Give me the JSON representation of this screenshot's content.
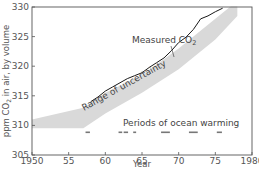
{
  "chart_data": {
    "type": "line",
    "title": "",
    "xlabel": "Year",
    "ylabel": "ppm CO2 in air, by volume",
    "xlim": [
      1950,
      1980
    ],
    "ylim": [
      305,
      330
    ],
    "x_ticks": [
      1950,
      1955,
      1960,
      1965,
      1970,
      1975,
      1980
    ],
    "x_tick_labels": [
      "1950",
      "55",
      "60",
      "65",
      "70",
      "75",
      "1980"
    ],
    "y_ticks": [
      305,
      310,
      315,
      320,
      325,
      330
    ],
    "y_tick_labels": [
      "305",
      "310",
      "315",
      "320",
      "325",
      "330"
    ],
    "grid": false,
    "series": [
      {
        "name": "Measured CO2",
        "type": "line",
        "x": [
          1958,
          1959,
          1960,
          1961,
          1962,
          1963,
          1964,
          1965,
          1966,
          1967,
          1968,
          1969,
          1970,
          1971,
          1972,
          1973,
          1974,
          1975,
          1976
        ],
        "values": [
          314.0,
          314.8,
          315.8,
          316.5,
          317.2,
          317.9,
          318.4,
          318.9,
          319.8,
          320.6,
          321.4,
          322.6,
          324.0,
          324.9,
          326.2,
          328.0,
          328.5,
          329.2,
          329.8
        ]
      },
      {
        "name": "Range of uncertainty",
        "type": "area",
        "x": [
          1950,
          1957,
          1960,
          1965,
          1970,
          1975,
          1978
        ],
        "lower": [
          309.5,
          309.5,
          312.0,
          315.5,
          319.5,
          324.5,
          328.5
        ],
        "upper": [
          311.0,
          313.0,
          315.5,
          318.5,
          323.0,
          328.0,
          331.0
        ]
      }
    ],
    "ocean_warming_periods": [
      [
        1957.3,
        1957.9
      ],
      [
        1961.8,
        1962.3
      ],
      [
        1962.5,
        1963.1
      ],
      [
        1963.8,
        1964.2
      ],
      [
        1967.6,
        1968.8
      ],
      [
        1971.4,
        1972.6
      ],
      [
        1975.2,
        1975.9
      ]
    ],
    "annotations": [
      {
        "text": "Measured CO2",
        "x": 1963.5,
        "y": 325.5
      },
      {
        "text": "Range of uncertainty",
        "x": 1957.5,
        "y": 316,
        "rotation": -28
      },
      {
        "text": "Periods of ocean warming",
        "x": 1961.5,
        "y": 310
      }
    ],
    "legend": null
  },
  "labels": {
    "measured": "Measured CO",
    "measured_sub": "2",
    "range": "Range of uncertainty",
    "ocean": "Periods of ocean warming",
    "xlabel": "Year",
    "ylabel_pre": "ppm CO",
    "ylabel_sub": "2",
    "ylabel_post": " in air, by volume"
  },
  "colors": {
    "band": "#d9d9d9",
    "line": "#1a1a1a",
    "axis": "#555555",
    "marker": "#777777"
  }
}
